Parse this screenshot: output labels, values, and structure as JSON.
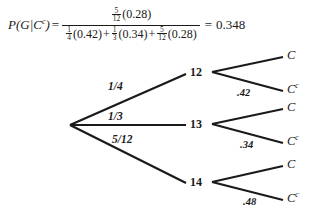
{
  "equation": {
    "lhs": "P(G|C",
    "lhs_sup": "c",
    "lhs_close": ")",
    "equals": "=",
    "numerator": {
      "fraction_num": "5",
      "fraction_den": "12",
      "factor": "(0.28)"
    },
    "denominator": {
      "terms": [
        {
          "fraction_num": "1",
          "fraction_den": "4",
          "factor": "(0.42)"
        },
        {
          "fraction_num": "1",
          "fraction_den": "3",
          "factor": "(0.34)"
        },
        {
          "fraction_num": "5",
          "fraction_den": "12",
          "factor": "(0.28)"
        }
      ],
      "operator": "+"
    },
    "result_equals": "=",
    "result": "0.348"
  },
  "tree": {
    "root": {
      "label": ""
    },
    "branches": [
      {
        "prob_label": "1/4",
        "node_label": "12",
        "leaves": [
          {
            "label": "C",
            "sup": "",
            "prob": ""
          },
          {
            "label": "C",
            "sup": "c",
            "prob": ".42"
          }
        ]
      },
      {
        "prob_label": "1/3",
        "node_label": "13",
        "leaves": [
          {
            "label": "C",
            "sup": "",
            "prob": ""
          },
          {
            "label": "C",
            "sup": "c",
            "prob": ".34"
          }
        ]
      },
      {
        "prob_label": "5/12",
        "node_label": "14",
        "leaves": [
          {
            "label": "C",
            "sup": "",
            "prob": ""
          },
          {
            "label": "C",
            "sup": "c",
            "prob": ".48"
          }
        ]
      }
    ]
  },
  "colors": {
    "ink": "#1a1a1a",
    "background": "#ffffff"
  }
}
